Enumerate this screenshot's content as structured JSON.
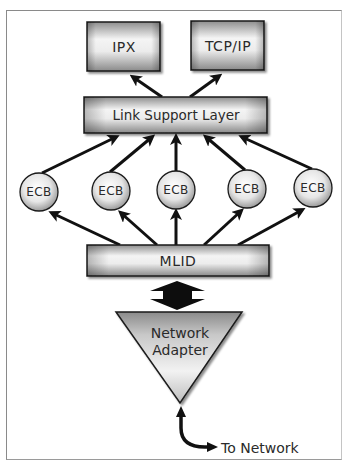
{
  "diagram": {
    "protocols": [
      {
        "label": "IPX"
      },
      {
        "label": "TCP/IP"
      }
    ],
    "link_support_layer": {
      "label": "Link Support Layer"
    },
    "ecbs": [
      {
        "label": "ECB"
      },
      {
        "label": "ECB"
      },
      {
        "label": "ECB"
      },
      {
        "label": "ECB"
      },
      {
        "label": "ECB"
      }
    ],
    "mlid": {
      "label": "MLID"
    },
    "network_adapter": {
      "line1": "Network",
      "line2": "Adapter"
    },
    "to_network": {
      "label": "To Network"
    }
  },
  "colors": {
    "box_fill_light": "#f2f2f2",
    "box_fill_dark": "#9a9a9a",
    "outline": "#1a1a1a",
    "arrow": "#111111",
    "text": "#2a2a2a",
    "frame": "#8a8a8a"
  }
}
